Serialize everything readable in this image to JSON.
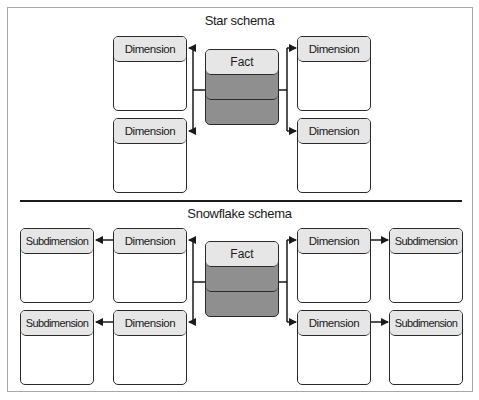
{
  "star": {
    "title": "Star schema",
    "fact": {
      "label": "Fact"
    },
    "dimensions": [
      {
        "label": "Dimension"
      },
      {
        "label": "Dimension"
      },
      {
        "label": "Dimension"
      },
      {
        "label": "Dimension"
      }
    ]
  },
  "snowflake": {
    "title": "Snowflake schema",
    "fact": {
      "label": "Fact"
    },
    "dimensions": [
      {
        "label": "Dimension"
      },
      {
        "label": "Dimension"
      },
      {
        "label": "Dimension"
      },
      {
        "label": "Dimension"
      }
    ],
    "subdimensions": [
      {
        "label": "Subdimension"
      },
      {
        "label": "Subdimension"
      },
      {
        "label": "Subdimension"
      },
      {
        "label": "Subdimension"
      }
    ]
  },
  "colors": {
    "header_fill": "#e6e6e6",
    "fact_fill": "#8f8f8f",
    "stroke": "#2a2a2a",
    "frame": "#a8a8a8"
  }
}
